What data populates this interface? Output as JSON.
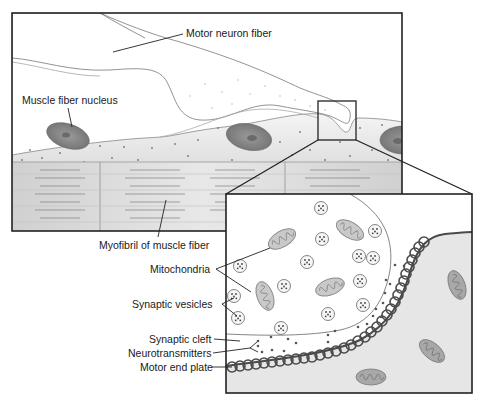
{
  "figure": {
    "type": "anatomical-diagram"
  },
  "labels": {
    "motor_neuron_fiber": "Motor neuron fiber",
    "muscle_fiber_nucleus": "Muscle fiber nucleus",
    "myofibril": "Myofibril of muscle fiber",
    "mitochondria": "Mitochondria",
    "synaptic_vesicles": "Synaptic vesicles",
    "synaptic_cleft": "Synaptic cleft",
    "neurotransmitters": "Neurotransmitters",
    "motor_end_plate": "Motor end plate"
  },
  "colors": {
    "outline": "#2a2a2a",
    "muscle_fill": "#e6e6e6",
    "myofibril_fill": "#d4d4d4",
    "nucleus_fill": "#8a8a8a",
    "nucleus_inner": "#6e6e6e",
    "mitochondria_fill": "#c8c8c8",
    "end_plate_stroke": "#4a4a4a",
    "postsynaptic_fill": "#e4e4e4",
    "terminal_fill": "#ffffff",
    "dot": "#555555"
  }
}
